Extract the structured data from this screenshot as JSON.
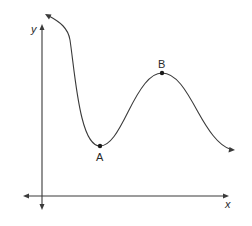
{
  "diagram": {
    "type": "function-graph",
    "axes": {
      "x_label": "x",
      "y_label": "y"
    },
    "points": [
      {
        "id": "A",
        "label": "A",
        "kind": "local minimum"
      },
      {
        "id": "B",
        "label": "B",
        "kind": "local maximum"
      }
    ],
    "curve": {
      "description": "Curve entering from upper left (arrow), falling steeply to local minimum A, rising to local maximum B, then falling toward lower right (arrow)"
    },
    "colors": {
      "stroke": "#3a3a3a",
      "point": "#1a1a1a",
      "background": "#ffffff"
    }
  }
}
